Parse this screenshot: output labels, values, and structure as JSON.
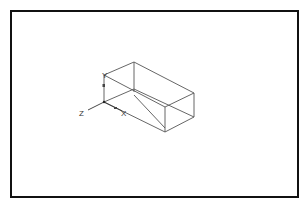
{
  "drawing": {
    "description": "Isometric wireframe of a rectangular box with UCS axis icon",
    "ucs_icon": {
      "labels": {
        "z": "Z",
        "x": "X",
        "y": "Y"
      }
    },
    "colors": {
      "frame": "#111111",
      "edges": "#555555",
      "background": "#ffffff"
    }
  }
}
